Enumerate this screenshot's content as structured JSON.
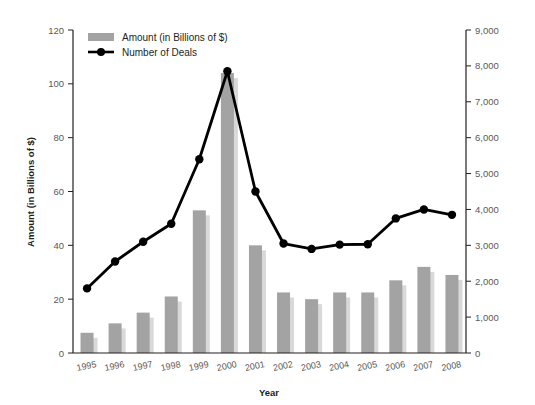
{
  "chart_data": {
    "type": "bar",
    "title": "",
    "xlabel": "Year",
    "ylabel": "Amount (in Billions of $)",
    "y2label": "",
    "categories": [
      "1995",
      "1996",
      "1997",
      "1998",
      "1999",
      "2000",
      "2001",
      "2002",
      "2003",
      "2004",
      "2005",
      "2006",
      "2007",
      "2008"
    ],
    "ylim": [
      0,
      120
    ],
    "y2lim": [
      0,
      9000
    ],
    "yticks": [
      "0",
      "20",
      "40",
      "60",
      "80",
      "100",
      "120"
    ],
    "y2ticks": [
      "0",
      "1,000",
      "2,000",
      "3,000",
      "4,000",
      "5,000",
      "6,000",
      "7,000",
      "8,000",
      "9,000"
    ],
    "grid": false,
    "legend_position": "top-left",
    "series": [
      {
        "name": "Amount (in Billions of $)",
        "kind": "bar",
        "axis": "left",
        "color": "#a3a3a3",
        "shadow_color": "#d9d9d9",
        "values": [
          7.5,
          11,
          15,
          21,
          53,
          104,
          40,
          22.5,
          20,
          22.5,
          22.5,
          27,
          32,
          29
        ]
      },
      {
        "name": "Number of Deals",
        "kind": "line",
        "axis": "right",
        "color": "#000000",
        "values": [
          1800,
          2550,
          3100,
          3600,
          5400,
          7850,
          4500,
          3050,
          2900,
          3020,
          3030,
          3750,
          4000,
          3850
        ]
      }
    ]
  },
  "legend": {
    "items": [
      {
        "label": "Amount (in Billions of $)",
        "type": "swatch"
      },
      {
        "label": "Number of Deals",
        "type": "line-marker"
      }
    ]
  },
  "axes": {
    "left": {
      "title": "Amount (in Billions of $)",
      "ticks": [
        "0",
        "20",
        "40",
        "60",
        "80",
        "100",
        "120"
      ]
    },
    "right": {
      "ticks": [
        "0",
        "1,000",
        "2,000",
        "3,000",
        "4,000",
        "5,000",
        "6,000",
        "7,000",
        "8,000",
        "9,000"
      ]
    },
    "bottom": {
      "title": "Year",
      "ticks": [
        "1995",
        "1996",
        "1997",
        "1998",
        "1999",
        "2000",
        "2001",
        "2002",
        "2003",
        "2004",
        "2005",
        "2006",
        "2007",
        "2008"
      ]
    }
  }
}
